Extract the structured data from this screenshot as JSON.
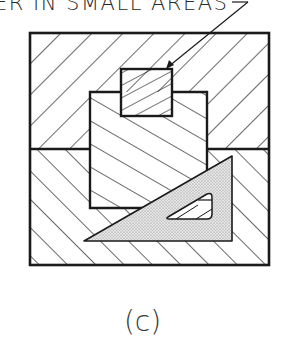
{
  "callout": {
    "text": "ER IN SMALL AREAS"
  },
  "figure": {
    "label": "(c)"
  },
  "drawing": {
    "description": "Section-lined assembly with drafting triangle used as guide in small areas",
    "parts": [
      {
        "name": "outer-block-upper",
        "hatch": "backslash"
      },
      {
        "name": "outer-block-lower",
        "hatch": "forward-slash"
      },
      {
        "name": "center-block",
        "hatch": "forward-slash-shallow"
      },
      {
        "name": "small-insert",
        "hatch": "backslash-shallow"
      },
      {
        "name": "drafting-triangle",
        "fill": "stippled-gray"
      }
    ],
    "colors": {
      "line": "#1a1a1a",
      "triangle_fill": "#d9d9d9",
      "background": "#ffffff"
    }
  }
}
